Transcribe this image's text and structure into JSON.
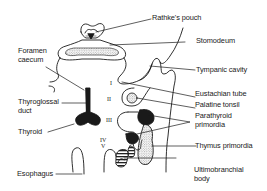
{
  "diagram": {
    "type": "anatomical-line-drawing",
    "colors": {
      "ink": "#1a1a1a",
      "background": "#ffffff",
      "stipple": "#bdbdbd"
    },
    "labels": {
      "rathkes_pouch": "Rathke's pouch",
      "stomodeum": "Stomodeum",
      "foramen_caecum_1": "Foramen",
      "foramen_caecum_2": "caecum",
      "tympanic_cavity": "Tympanic cavity",
      "eustachian_tube": "Eustachian tube",
      "palatine_tonsil": "Palatine tonsil",
      "thyroglossal_duct_1": "Thyroglossal",
      "thyroglossal_duct_2": "duct",
      "parathyroid_primordia_1": "Parathyroid",
      "parathyroid_primordia_2": "primordia",
      "thyroid": "Thyroid",
      "thymus_primordia": "Thymus primordia",
      "esophagus": "Esophagus",
      "ultimobranchial_body_1": "Ultimobranchial",
      "ultimobranchial_body_2": "body"
    },
    "pouch_numerals": {
      "i": "I",
      "ii": "II",
      "iii": "III",
      "iv": "IV",
      "v": "V"
    }
  }
}
